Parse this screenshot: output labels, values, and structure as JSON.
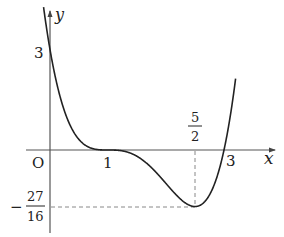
{
  "figure": {
    "function": "y = (x-1)^3 (x-3)",
    "axes": {
      "x_label": "x",
      "y_label": "y",
      "origin_label": "O"
    },
    "ticks": {
      "x_one": "1",
      "x_three": "3",
      "x_min_num": "5",
      "x_min_den": "2",
      "y_intercept": "3",
      "y_min_sign": "−",
      "y_min_num": "27",
      "y_min_den": "16"
    },
    "key_points": [
      {
        "name": "y-intercept",
        "x": 0,
        "y": 3
      },
      {
        "name": "inflection/tangent",
        "x": 1,
        "y": 0
      },
      {
        "name": "minimum",
        "x": 2.5,
        "y": -1.6875
      },
      {
        "name": "root",
        "x": 3,
        "y": 0
      }
    ],
    "colors": {
      "curve": "#222222",
      "axis": "#555555",
      "dashed": "#888888"
    }
  }
}
